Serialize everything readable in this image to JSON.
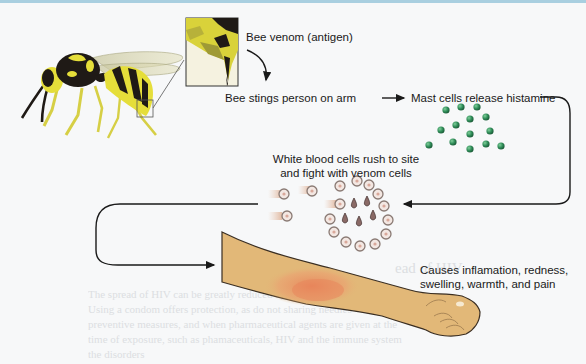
{
  "diagram": {
    "labels": {
      "venom": "Bee venom (antigen)",
      "sting": "Bee stings person on arm",
      "histamine": "Mast cells release histamine",
      "wbc_line1": "White blood cells rush to site",
      "wbc_line2": "and fight with venom cells",
      "effect_line1": "Causes inflamation, redness,",
      "effect_line2": "swelling, warmth, and pain"
    },
    "icons": {
      "wasp": "wasp-illustration",
      "stinger_zoom": "stinger-closeup-inset",
      "histamine": "histamine-granules",
      "wbc": "white-blood-cells",
      "venom_cells": "venom-droplets",
      "arm": "arm-with-inflamed-area"
    },
    "colors": {
      "histamine_green": "#2e8b57",
      "skin": "#e2b878",
      "inflammation": "#e8845a",
      "wasp_yellow": "#e5de3a",
      "wasp_black": "#1f1a16",
      "wbc_ring": "#8a7a74",
      "arrow": "#1a1a1a"
    },
    "bleed_through": {
      "heading": "ead of HIV",
      "line1": "The spread of HIV can be greatly reduced by following",
      "line2": "Using a condom offers protection, as do not sharing needles",
      "line3": "preventive measures, and when pharmaceutical agents are given at the",
      "line4": "time of exposure, such as phamaceuticals, HIV and the immune system",
      "line5": "the disorders"
    }
  }
}
